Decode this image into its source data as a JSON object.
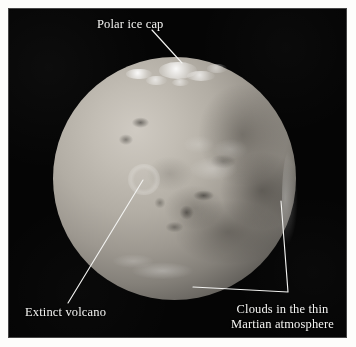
{
  "figure": {
    "kind": "annotated-photograph",
    "background_color": "#ffffff",
    "plate_color": "#050505",
    "label_color": "#f4f4f2",
    "leader_color": "#f2f2f0"
  },
  "annotations": [
    {
      "id": "polar-ice-cap",
      "label": "Polar ice cap",
      "lines": [
        "Polar ice cap"
      ],
      "leader_from": [
        152,
        30
      ],
      "leader_to": [
        182,
        63
      ]
    },
    {
      "id": "extinct-volcano",
      "label": "Extinct volcano",
      "lines": [
        "Extinct volcano"
      ],
      "leader_from": [
        68,
        303
      ],
      "leader_to": [
        143,
        180
      ]
    },
    {
      "id": "clouds",
      "label": "Clouds in the thin Martian atmosphere",
      "lines": [
        "Clouds in the thin",
        "Martian atmosphere"
      ],
      "leader_vertex": [
        288,
        292
      ],
      "leader_to_limb": [
        281,
        201
      ],
      "leader_to_band": [
        193,
        287
      ]
    }
  ],
  "planet": {
    "name": "Mars",
    "disk_center": [
      174,
      178
    ],
    "disk_radius": 121,
    "features": [
      "polar ice cap",
      "extinct volcano",
      "clouds in the thin Martian atmosphere",
      "dark mare regions",
      "bright limb haze"
    ]
  }
}
